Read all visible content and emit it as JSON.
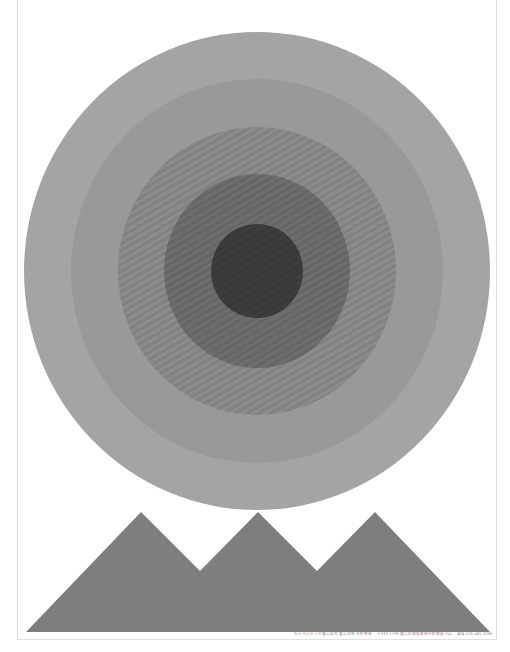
{
  "poster": {
    "background": "#ffffff",
    "circle": {
      "center": {
        "x": 257,
        "y": 271
      },
      "rings": [
        {
          "name": "ring-outer",
          "rx": 233,
          "ry": 239,
          "color": "#a4a4a4"
        },
        {
          "name": "ring-2",
          "rx": 186,
          "ry": 192,
          "color": "#999999"
        },
        {
          "name": "ring-3",
          "rx": 139,
          "ry": 144,
          "color": "#8b8b8b"
        },
        {
          "name": "ring-4",
          "rx": 93,
          "ry": 97,
          "color": "#6e6e6e"
        },
        {
          "name": "ring-core",
          "rx": 46,
          "ry": 47,
          "color": "#3d3d3d"
        }
      ]
    },
    "mountains": {
      "color": "#7e7e7e",
      "points": "26,632 141,512 200,571 258,512 317,571 375,512 490,632"
    },
    "caption": {
      "line1": "おんぺいビック富山店内 富山市新庄町番地",
      "line2": "〒939-2798 富山県婦負郡婦中町速星754",
      "line3": "電話 076-465-2788"
    }
  }
}
